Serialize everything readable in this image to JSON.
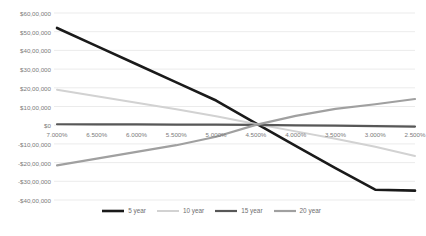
{
  "chart_data": {
    "type": "line",
    "title": "",
    "subtitle": "",
    "xlabel": "",
    "ylabel": "",
    "grid": true,
    "legend_position": "bottom",
    "categories": [
      "7.000%",
      "6.500%",
      "6.000%",
      "5.500%",
      "5.000%",
      "4.500%",
      "4.000%",
      "3.500%",
      "3.000%",
      "2.500%"
    ],
    "ylim": [
      -4000000,
      6000000
    ],
    "ytick_values": [
      6000000,
      5000000,
      4000000,
      3000000,
      2000000,
      1000000,
      0,
      -1000000,
      -2000000,
      -3000000,
      -4000000
    ],
    "ytick_labels": [
      "$60,00,000",
      "$50,00,000",
      "$40,00,000",
      "$30,00,000",
      "$20,00,000",
      "$10,00,000",
      "$0",
      "-$10,00,000",
      "-$20,00,000",
      "-$30,00,000",
      "-$40,00,000"
    ],
    "series": [
      {
        "name": "5 year",
        "color": "#1a1a1a",
        "width": 2.6,
        "values": [
          5200000,
          4230000,
          3260000,
          2290000,
          1320000,
          100000,
          -1100000,
          -2300000,
          -3450000,
          -3500000
        ]
      },
      {
        "name": "10 year",
        "color": "#d2d2d2",
        "width": 2.0,
        "values": [
          1900000,
          1550000,
          1200000,
          850000,
          480000,
          60000,
          -330000,
          -720000,
          -1150000,
          -1650000
        ]
      },
      {
        "name": "15 year",
        "color": "#575757",
        "width": 2.2,
        "values": [
          50000,
          45000,
          40000,
          35000,
          28000,
          15000,
          -5000,
          -25000,
          -45000,
          -75000
        ]
      },
      {
        "name": "20 year",
        "color": "#a0a0a0",
        "width": 2.2,
        "values": [
          -2150000,
          -1790000,
          -1430000,
          -1070000,
          -620000,
          20000,
          500000,
          870000,
          1120000,
          1400000
        ]
      }
    ]
  },
  "legend": {
    "items": [
      {
        "label": "5 year"
      },
      {
        "label": "10 year"
      },
      {
        "label": "15 year"
      },
      {
        "label": "20 year"
      }
    ]
  }
}
